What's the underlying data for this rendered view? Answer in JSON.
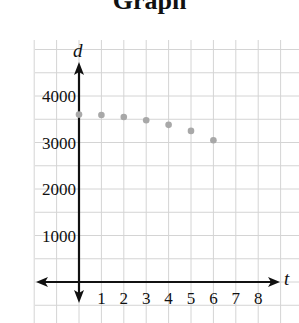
{
  "chart_data": {
    "type": "scatter",
    "title": "Graph",
    "xlabel": "t",
    "ylabel": "d",
    "x_ticks": [
      "1",
      "2",
      "3",
      "4",
      "5",
      "6",
      "7",
      "8"
    ],
    "y_ticks": [
      "1000",
      "2000",
      "3000",
      "4000"
    ],
    "xlim": [
      -2,
      9
    ],
    "ylim": [
      -500,
      5000
    ],
    "grid": true,
    "legend": null,
    "series": [
      {
        "name": "d",
        "color": "#a8a8a8",
        "points": [
          {
            "x": 0,
            "y": 3600
          },
          {
            "x": 1,
            "y": 3590
          },
          {
            "x": 2,
            "y": 3550
          },
          {
            "x": 3,
            "y": 3480
          },
          {
            "x": 4,
            "y": 3380
          },
          {
            "x": 5,
            "y": 3250
          },
          {
            "x": 6,
            "y": 3050
          }
        ]
      }
    ]
  },
  "style": {
    "grid_color": "#d4d4d4",
    "axis_color": "#111111"
  }
}
